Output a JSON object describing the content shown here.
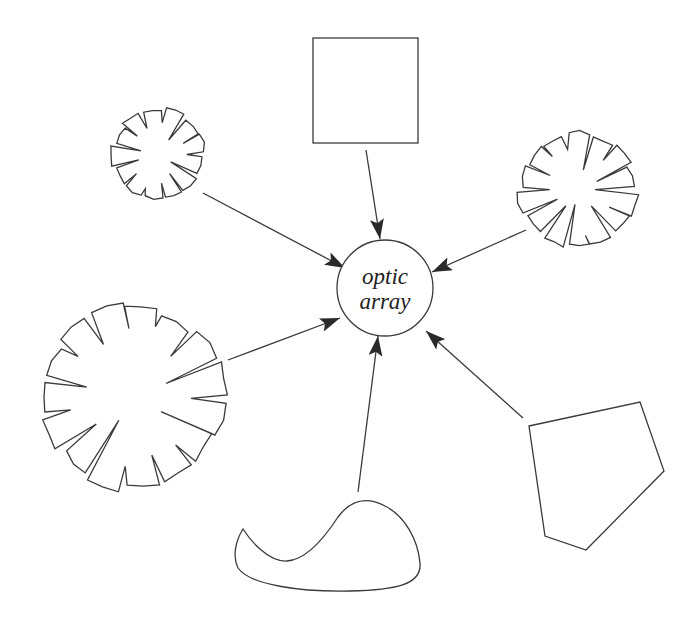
{
  "diagram": {
    "title": "",
    "center_node": {
      "id": "optic-array",
      "label_lines": [
        "optic",
        "array"
      ],
      "shape": "circle"
    },
    "source_nodes": [
      {
        "id": "square",
        "shape": "square",
        "label": ""
      },
      {
        "id": "burst-top-left",
        "shape": "serrated-disc-small",
        "label": ""
      },
      {
        "id": "burst-right",
        "shape": "serrated-disc-medium",
        "label": ""
      },
      {
        "id": "burst-bottom-left",
        "shape": "serrated-disc-large",
        "label": ""
      },
      {
        "id": "blob",
        "shape": "irregular-blob",
        "label": ""
      },
      {
        "id": "pentagon",
        "shape": "irregular-pentagon",
        "label": ""
      }
    ],
    "edges": [
      {
        "from": "square",
        "to": "optic-array",
        "directed": true
      },
      {
        "from": "burst-top-left",
        "to": "optic-array",
        "directed": true
      },
      {
        "from": "burst-right",
        "to": "optic-array",
        "directed": true
      },
      {
        "from": "burst-bottom-left",
        "to": "optic-array",
        "directed": true
      },
      {
        "from": "blob",
        "to": "optic-array",
        "directed": true
      },
      {
        "from": "pentagon",
        "to": "optic-array",
        "directed": true
      }
    ],
    "colors": {
      "stroke": "#3a3a3a",
      "background": "#ffffff",
      "text": "#222222"
    }
  }
}
